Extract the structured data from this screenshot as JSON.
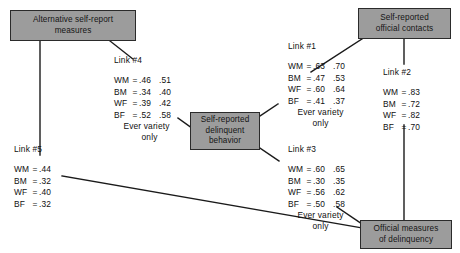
{
  "figure": {
    "type": "path-diagram",
    "nodes": [
      {
        "id": "alt-self-report",
        "label": "Alternative self-report measures",
        "line1": "Alternative self-report",
        "line2": "measures"
      },
      {
        "id": "self-reported-official-contacts",
        "label": "Self-reported official contacts",
        "line1": "Self-reported",
        "line2": "official contacts"
      },
      {
        "id": "self-reported-delinquent-behavior",
        "label": "Self-reported delinquent behavior",
        "line1": "Self-reported",
        "line2": "delinquent",
        "line3": "behavior"
      },
      {
        "id": "official-measures-of-delinquency",
        "label": "Official measures of delinquency",
        "line1": "Official measures",
        "line2": "of delinquency"
      }
    ],
    "links": [
      {
        "id": "link1",
        "title": "Link #1",
        "note1": "Ever variety",
        "note2": "only",
        "rows": [
          {
            "group": "WM",
            "eq": "=",
            "v1": ".63",
            "v2": ".70"
          },
          {
            "group": "BM",
            "eq": "=",
            "v1": ".47",
            "v2": ".53"
          },
          {
            "group": "WF",
            "eq": "=",
            "v1": ".60",
            "v2": ".64"
          },
          {
            "group": "BF",
            "eq": "=",
            "v1": ".41",
            "v2": ".37"
          }
        ]
      },
      {
        "id": "link2",
        "title": "Link #2",
        "note1": "",
        "note2": "",
        "rows": [
          {
            "group": "WM",
            "eq": "=",
            "v1": ".83",
            "v2": ""
          },
          {
            "group": "BM",
            "eq": "=",
            "v1": ".72",
            "v2": ""
          },
          {
            "group": "WF",
            "eq": "=",
            "v1": ".82",
            "v2": ""
          },
          {
            "group": "BF",
            "eq": "=",
            "v1": ".70",
            "v2": ""
          }
        ]
      },
      {
        "id": "link3",
        "title": "Link #3",
        "note1": "Ever variety",
        "note2": "only",
        "rows": [
          {
            "group": "WM",
            "eq": "=",
            "v1": ".60",
            "v2": ".65"
          },
          {
            "group": "BM",
            "eq": "=",
            "v1": ".30",
            "v2": ".35"
          },
          {
            "group": "WF",
            "eq": "=",
            "v1": ".56",
            "v2": ".62"
          },
          {
            "group": "BF",
            "eq": "=",
            "v1": ".50",
            "v2": ".58"
          }
        ]
      },
      {
        "id": "link4",
        "title": "Link #4",
        "note1": "Ever variety",
        "note2": "only",
        "rows": [
          {
            "group": "WM",
            "eq": "=",
            "v1": ".46",
            "v2": ".51"
          },
          {
            "group": "BM",
            "eq": "=",
            "v1": ".34",
            "v2": ".40"
          },
          {
            "group": "WF",
            "eq": "=",
            "v1": ".39",
            "v2": ".42"
          },
          {
            "group": "BF",
            "eq": "=",
            "v1": ".52",
            "v2": ".58"
          }
        ]
      },
      {
        "id": "link5",
        "title": "Link #5",
        "note1": "",
        "note2": "",
        "rows": [
          {
            "group": "WM",
            "eq": "=",
            "v1": ".44",
            "v2": ""
          },
          {
            "group": "BM",
            "eq": "=",
            "v1": ".32",
            "v2": ""
          },
          {
            "group": "WF",
            "eq": "=",
            "v1": ".40",
            "v2": ""
          },
          {
            "group": "BF",
            "eq": "=",
            "v1": ".32",
            "v2": ""
          }
        ]
      }
    ],
    "colors": {
      "node_fill": "#9c9c9c",
      "node_border": "#2b2b2b",
      "line": "#1a1a1a",
      "text": "#101010",
      "background": "#ffffff"
    }
  }
}
